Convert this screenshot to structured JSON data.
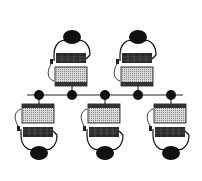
{
  "diagram": {
    "type": "bus-network-topology",
    "bus": {
      "y": 95,
      "x1": 27,
      "x2": 183,
      "color": "#222222"
    },
    "nodes": [
      {
        "x": 39,
        "label": ""
      },
      {
        "x": 72,
        "label": ""
      },
      {
        "x": 105,
        "label": ""
      },
      {
        "x": 138,
        "label": ""
      },
      {
        "x": 171,
        "label": ""
      }
    ],
    "workstations": [
      {
        "id": "top-left",
        "x": 72,
        "position": "top"
      },
      {
        "id": "top-right",
        "x": 138,
        "position": "top"
      },
      {
        "id": "bottom-left",
        "x": 39,
        "position": "bottom"
      },
      {
        "id": "bottom-center",
        "x": 105,
        "position": "bottom"
      },
      {
        "id": "bottom-right",
        "x": 171,
        "position": "bottom"
      }
    ],
    "colors": {
      "ink": "#111111",
      "screen": "#bdbdbd",
      "keyboard": "#333333"
    }
  }
}
